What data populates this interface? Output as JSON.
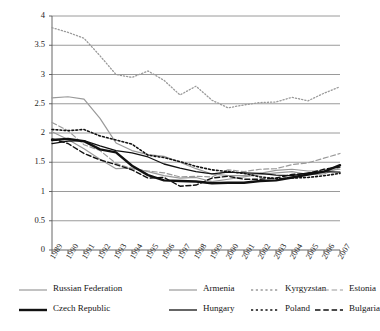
{
  "chart_data": {
    "type": "line",
    "title": "",
    "subtitle": "",
    "xlabel": "",
    "ylabel": "",
    "xlim": [
      1989,
      2007
    ],
    "ylim": [
      0,
      4
    ],
    "grid": true,
    "grid_axis": "y",
    "legend_position": "bottom",
    "legend_columns": 4,
    "x": [
      1989,
      1990,
      1991,
      1992,
      1993,
      1994,
      1995,
      1996,
      1997,
      1998,
      1999,
      2000,
      2001,
      2002,
      2003,
      2004,
      2005,
      2006,
      2007
    ],
    "categories": [
      "1989",
      "1990",
      "1991",
      "1992",
      "1993",
      "1994",
      "1995",
      "1996",
      "1997",
      "1998",
      "1999",
      "2000",
      "2001",
      "2002",
      "2003",
      "2004",
      "2005",
      "2006",
      "2007"
    ],
    "yticks": [
      0,
      0.5,
      1,
      1.5,
      2,
      2.5,
      3,
      3.5,
      4
    ],
    "ytick_labels": [
      "0",
      "0.5",
      "1",
      "1.5",
      "2",
      "2.5",
      "3",
      "3.5",
      "4"
    ],
    "series": [
      {
        "name": "Russian Federation",
        "color": "#9a9a9a",
        "style": "solid",
        "width": 1.2,
        "values": [
          2.02,
          1.89,
          1.73,
          1.55,
          1.39,
          1.4,
          1.34,
          1.27,
          1.23,
          1.24,
          1.17,
          1.21,
          1.25,
          1.29,
          1.32,
          1.34,
          1.29,
          1.3,
          1.41
        ]
      },
      {
        "name": "Armenia",
        "color": "#9a9a9a",
        "style": "solid",
        "width": 1.2,
        "values": [
          2.6,
          2.62,
          2.58,
          2.25,
          1.83,
          1.7,
          1.63,
          1.6,
          1.5,
          1.39,
          1.3,
          1.27,
          1.27,
          1.31,
          1.36,
          1.38,
          1.35,
          1.35,
          1.38
        ]
      },
      {
        "name": "Kyrgyzstan",
        "color": "#9a9a9a",
        "style": "dotted",
        "width": 1.3,
        "values": [
          3.8,
          3.72,
          3.62,
          3.32,
          3.0,
          2.95,
          3.06,
          2.9,
          2.65,
          2.8,
          2.56,
          2.43,
          2.48,
          2.52,
          2.53,
          2.61,
          2.55,
          2.68,
          2.79
        ]
      },
      {
        "name": "Estonia",
        "color": "#9a9a9a",
        "style": "dashed",
        "width": 1.2,
        "values": [
          2.18,
          2.04,
          1.8,
          1.7,
          1.48,
          1.39,
          1.35,
          1.32,
          1.25,
          1.26,
          1.25,
          1.37,
          1.34,
          1.38,
          1.39,
          1.46,
          1.49,
          1.57,
          1.65
        ]
      },
      {
        "name": "Czech Republic",
        "color": "#111111",
        "style": "solid",
        "width": 2.4,
        "values": [
          1.88,
          1.9,
          1.86,
          1.72,
          1.67,
          1.44,
          1.28,
          1.19,
          1.18,
          1.17,
          1.14,
          1.15,
          1.15,
          1.18,
          1.19,
          1.24,
          1.29,
          1.34,
          1.45
        ]
      },
      {
        "name": "Hungary",
        "color": "#111111",
        "style": "solid",
        "width": 1.3,
        "values": [
          1.82,
          1.86,
          1.87,
          1.78,
          1.7,
          1.66,
          1.59,
          1.47,
          1.4,
          1.34,
          1.3,
          1.33,
          1.32,
          1.31,
          1.28,
          1.27,
          1.32,
          1.34,
          1.33
        ]
      },
      {
        "name": "Poland",
        "color": "#111111",
        "style": "dotted",
        "width": 1.6,
        "values": [
          2.06,
          2.04,
          2.06,
          1.95,
          1.88,
          1.81,
          1.62,
          1.58,
          1.51,
          1.43,
          1.37,
          1.34,
          1.31,
          1.25,
          1.22,
          1.23,
          1.24,
          1.27,
          1.31
        ]
      },
      {
        "name": "Bulgaria",
        "color": "#111111",
        "style": "dashed",
        "width": 1.4,
        "values": [
          1.9,
          1.82,
          1.65,
          1.54,
          1.46,
          1.37,
          1.23,
          1.24,
          1.09,
          1.11,
          1.23,
          1.26,
          1.21,
          1.21,
          1.23,
          1.29,
          1.31,
          1.38,
          1.42
        ]
      }
    ]
  },
  "legend": {
    "rows": [
      [
        {
          "label": "Russian Federation"
        },
        {
          "label": "Armenia"
        },
        {
          "label": "Kyrgyzstan"
        },
        {
          "label": "Estonia"
        }
      ],
      [
        {
          "label": "Czech Republic"
        },
        {
          "label": "Hungary"
        },
        {
          "label": "Poland"
        },
        {
          "label": "Bulgaria"
        }
      ]
    ]
  }
}
